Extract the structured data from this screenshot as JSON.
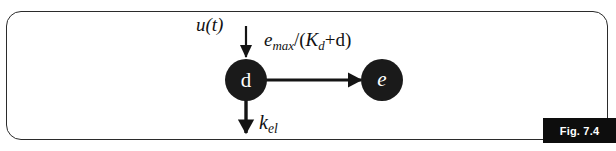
{
  "figure": {
    "badge_label": "Fig. 7.4",
    "frame": {
      "border_color": "#2b2b2b",
      "background_color": "#ffffff",
      "corner_radius": 15
    }
  },
  "diagram": {
    "type": "compartment-flow-diagram",
    "nodes": [
      {
        "id": "d",
        "letter": "d",
        "style": "italic-no",
        "cx": 246,
        "cy": 80,
        "r": 21,
        "fill": "#1a1a1a"
      },
      {
        "id": "e",
        "letter": "e",
        "style": "italic-yes",
        "cx": 382,
        "cy": 80,
        "r": 21,
        "fill": "#1a1a1a"
      }
    ],
    "arrows": [
      {
        "id": "input-arrow",
        "direction": "down",
        "from": [
          246,
          26
        ],
        "to": [
          246,
          58
        ],
        "stroke_width": 2.2
      },
      {
        "id": "conversion-arrow",
        "direction": "right",
        "from": [
          268,
          80
        ],
        "to": [
          360,
          80
        ],
        "stroke_width": 3.2
      },
      {
        "id": "elimination-arrow",
        "direction": "down",
        "from": [
          246,
          101
        ],
        "to": [
          246,
          134
        ],
        "stroke_width": 3.4
      }
    ]
  },
  "labels": {
    "input": {
      "text": "u(t)",
      "base": "u",
      "paren": "(t)"
    },
    "rate": {
      "full_text": "emax/(Kd+d)",
      "numerator_base": "e",
      "numerator_sub": "max",
      "slash": "/(",
      "denominator_base": "K",
      "denominator_sub": "d",
      "plus": "+d)"
    },
    "elimination": {
      "full_text": "kel",
      "base": "k",
      "sub": "el"
    }
  },
  "colors": {
    "ink": "#111111",
    "node_fill": "#1a1a1a",
    "frame_stroke": "#2b2b2b",
    "badge_background": "#0d0d0d",
    "badge_text": "#ffffff",
    "page_background": "#ffffff"
  }
}
